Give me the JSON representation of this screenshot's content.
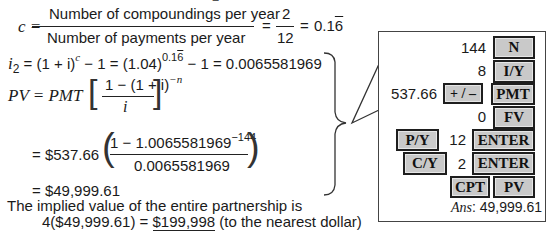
{
  "equations": {
    "top_fragment": "2",
    "c_eq": {
      "lhs": "c =",
      "numerator": "Number of compoundings per year",
      "denominator": "Number of payments per year",
      "eq1": "=",
      "frac_num": "2",
      "frac_den": "12",
      "eq2": "=",
      "result_prefix": "0.1",
      "result_repeat": "6"
    },
    "i2_eq": {
      "lhs": "i",
      "lhs_sub": "2",
      "part1": " = (1 + i)",
      "part1_sup": "c",
      "part2": " − 1 = (1.04)",
      "part2_sup_prefix": "0.1",
      "part2_sup_repeat": "6",
      "part3": " − 1 = 0.0065581969"
    },
    "pv_eq": {
      "lhs": "PV = PMT",
      "numerator": "1 − (1 + i)",
      "numerator_sup": "−n",
      "denominator": "i"
    },
    "pv_sub": {
      "prefix": "= $537.66",
      "numerator": "1 − 1.0065581969",
      "numerator_sup": "−144",
      "denominator": "0.0065581969"
    },
    "pv_result": "= $49,999.61",
    "implied_line": "The implied value of the entire partnership is",
    "final_prefix": "4($49,999.61) = ",
    "final_value": "$199,998",
    "final_suffix": " (to the nearest dollar)"
  },
  "calculator": {
    "rows": [
      {
        "value": "144",
        "key": "N"
      },
      {
        "value": "8",
        "key": "I/Y"
      },
      {
        "value": "537.66",
        "modifier": "+ / –",
        "key": "PMT"
      },
      {
        "value": "0",
        "key": "FV"
      },
      {
        "pre_key": "P/Y",
        "value": "12",
        "key": "ENTER"
      },
      {
        "pre_key": "C/Y",
        "value": "2",
        "key": "ENTER"
      },
      {
        "pre_key": "CPT",
        "key": "PV"
      }
    ],
    "answer_label": "Ans",
    "answer_value": ": 49,999.61"
  },
  "colors": {
    "key_fill": "#c9c9c9",
    "key_border": "#1e1e1e",
    "text": "#1a1a1a"
  }
}
